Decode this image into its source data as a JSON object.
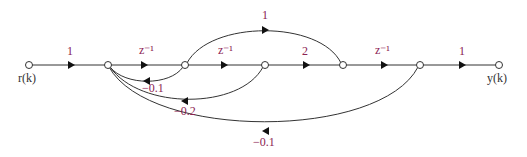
{
  "diagram": {
    "type": "signal-flow-graph",
    "colors": {
      "label": "#8b2252",
      "line": "#333333",
      "node_fill": "#ffffff"
    },
    "nodes": [
      {
        "id": "r",
        "label": "r(k)",
        "x": 29,
        "y": 65
      },
      {
        "id": "n1",
        "label": "",
        "x": 108,
        "y": 65
      },
      {
        "id": "n2",
        "label": "",
        "x": 185,
        "y": 65
      },
      {
        "id": "n3",
        "label": "",
        "x": 265,
        "y": 65
      },
      {
        "id": "n4",
        "label": "",
        "x": 343,
        "y": 65
      },
      {
        "id": "n5",
        "label": "",
        "x": 420,
        "y": 65
      },
      {
        "id": "y",
        "label": "y(k)",
        "x": 499,
        "y": 65
      }
    ],
    "edges": [
      {
        "from": "r",
        "to": "n1",
        "gain": "1"
      },
      {
        "from": "n1",
        "to": "n2",
        "gain": "z⁻¹"
      },
      {
        "from": "n2",
        "to": "n3",
        "gain": "z⁻¹"
      },
      {
        "from": "n3",
        "to": "n4",
        "gain": "2"
      },
      {
        "from": "n4",
        "to": "n5",
        "gain": "z⁻¹"
      },
      {
        "from": "n5",
        "to": "y",
        "gain": "1"
      },
      {
        "from": "n2",
        "to": "n4",
        "gain": "1"
      },
      {
        "from": "n2",
        "to": "n1",
        "gain": "−0.1"
      },
      {
        "from": "n3",
        "to": "n1",
        "gain": "−0.2"
      },
      {
        "from": "n5",
        "to": "n1",
        "gain": "−0.1"
      }
    ]
  }
}
